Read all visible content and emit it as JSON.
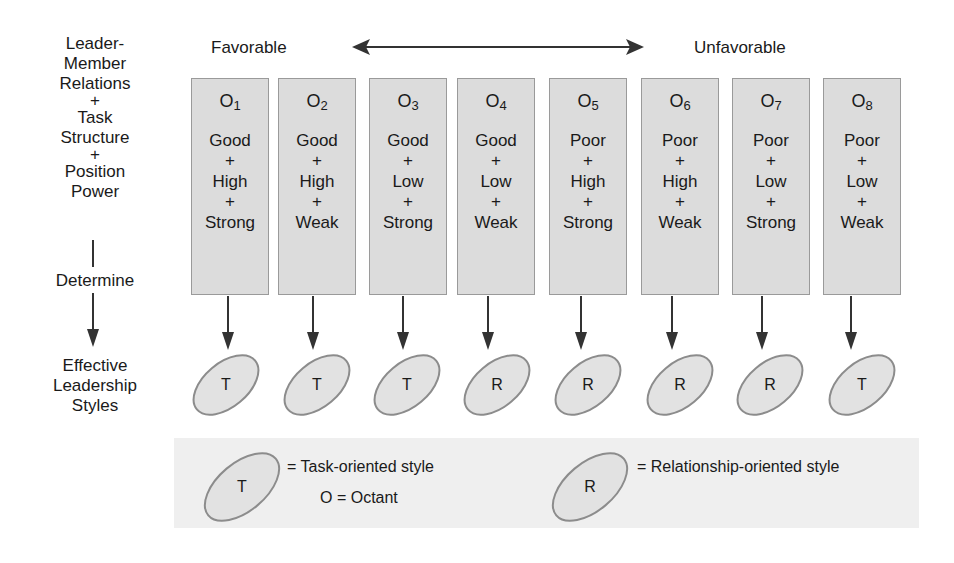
{
  "left_labels": {
    "lmr": [
      "Leader-",
      "Member",
      "Relations"
    ],
    "plus1": "+",
    "ts": [
      "Task",
      "Structure"
    ],
    "plus2": "+",
    "pp": [
      "Position",
      "Power"
    ],
    "determine": "Determine",
    "effective": [
      "Effective",
      "Leadership",
      "Styles"
    ]
  },
  "header": {
    "favorable": "Favorable",
    "unfavorable": "Unfavorable"
  },
  "octants": [
    {
      "o": "O",
      "sub": "1",
      "lmr": "Good",
      "ts": "High",
      "pp": "Strong",
      "style": "T"
    },
    {
      "o": "O",
      "sub": "2",
      "lmr": "Good",
      "ts": "High",
      "pp": "Weak",
      "style": "T"
    },
    {
      "o": "O",
      "sub": "3",
      "lmr": "Good",
      "ts": "Low",
      "pp": "Strong",
      "style": "T"
    },
    {
      "o": "O",
      "sub": "4",
      "lmr": "Good",
      "ts": "Low",
      "pp": "Weak",
      "style": "R"
    },
    {
      "o": "O",
      "sub": "5",
      "lmr": "Poor",
      "ts": "High",
      "pp": "Strong",
      "style": "R"
    },
    {
      "o": "O",
      "sub": "6",
      "lmr": "Poor",
      "ts": "High",
      "pp": "Weak",
      "style": "R"
    },
    {
      "o": "O",
      "sub": "7",
      "lmr": "Poor",
      "ts": "Low",
      "pp": "Strong",
      "style": "R"
    },
    {
      "o": "O",
      "sub": "8",
      "lmr": "Poor",
      "ts": "Low",
      "pp": "Weak",
      "style": "T"
    }
  ],
  "plus": "+",
  "legend": {
    "t_symbol": "T",
    "t_text": "= Task-oriented style",
    "o_text": "O = Octant",
    "r_symbol": "R",
    "r_text": "= Relationship-oriented style"
  },
  "colors": {
    "box_fill": "#dcdcdc",
    "box_border": "#9a9a9a",
    "ellipse_fill": "#e2e2e2",
    "ellipse_stroke": "#8c8c8c",
    "arrow": "#333333",
    "legend_bg": "#efefef"
  }
}
